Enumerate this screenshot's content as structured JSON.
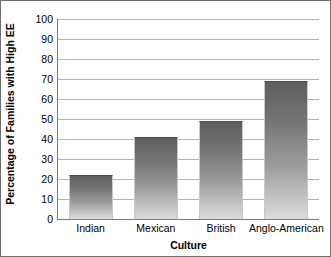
{
  "chart_data": {
    "type": "bar",
    "title": "",
    "subtitle": "",
    "xlabel": "Culture",
    "ylabel": "Percentage of Families with High EE",
    "categories": [
      "Indian",
      "Mexican",
      "British",
      "Anglo-American"
    ],
    "values": [
      22,
      41,
      49,
      69
    ],
    "ylim": [
      0,
      100
    ],
    "ytick_step": 10,
    "yticks": [
      0,
      10,
      20,
      30,
      40,
      50,
      60,
      70,
      80,
      90,
      100
    ],
    "ytick_labels": [
      "0",
      "10",
      "20",
      "30",
      "40",
      "50",
      "60",
      "70",
      "80",
      "90",
      "100"
    ],
    "grid": "horizontal",
    "legend": "none",
    "bar_fill": "gradient-gray",
    "bar_color_top": "#5e5e5e",
    "bar_color_bottom": "#dcdcdc",
    "gridline_color": "#b4b4b4",
    "axis_color": "#7a7a7a",
    "background_color": "#ffffff",
    "border_color": "#6e6e6e"
  }
}
